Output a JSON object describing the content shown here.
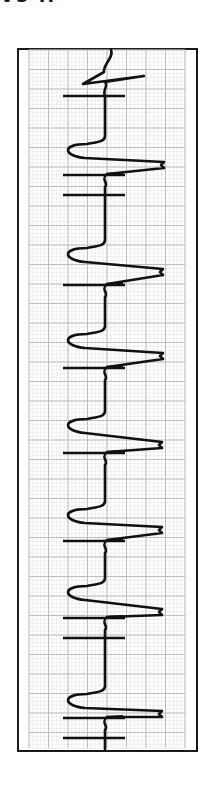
{
  "header": {
    "lead_label_fragment": "V5 II"
  },
  "colors": {
    "background": "#ffffff",
    "frame": "#1a1a1a",
    "grid_minor": "#e4e4e4",
    "grid_major": "#bdbdbd",
    "trace": "#111111"
  },
  "chart_data": {
    "type": "line",
    "xlabel": "",
    "ylabel": "",
    "grid": true,
    "orientation": "vertical",
    "frame": {
      "x": 17,
      "y": 48,
      "width": 179,
      "height": 702
    },
    "grid_area": {
      "x": 29,
      "y": 50,
      "width": 156,
      "height": 698,
      "major_step": 19.5,
      "minor_step": 3.9
    },
    "baseline_x": 105,
    "beats": [
      {
        "index": 0,
        "trough_y": 84,
        "trough_x": 83,
        "tip_y": 76,
        "tip_x": 144,
        "marks_y": [
          96
        ]
      },
      {
        "index": 1,
        "trough_y": 150,
        "trough_x": 67,
        "tip_y": 165,
        "tip_x": 164,
        "marks_y": [
          175,
          195
        ]
      },
      {
        "index": 2,
        "trough_y": 254,
        "trough_x": 67,
        "tip_y": 272,
        "tip_x": 163,
        "marks_y": [
          285
        ]
      },
      {
        "index": 3,
        "trough_y": 340,
        "trough_x": 67,
        "tip_y": 356,
        "tip_x": 163,
        "marks_y": [
          368
        ]
      },
      {
        "index": 4,
        "trough_y": 425,
        "trough_x": 67,
        "tip_y": 445,
        "tip_x": 162,
        "marks_y": [
          453
        ]
      },
      {
        "index": 5,
        "trough_y": 515,
        "trough_x": 67,
        "tip_y": 530,
        "tip_x": 162,
        "marks_y": [
          541
        ]
      },
      {
        "index": 6,
        "trough_y": 592,
        "trough_x": 67,
        "tip_y": 612,
        "tip_x": 162,
        "marks_y": [
          618,
          638
        ]
      },
      {
        "index": 7,
        "trough_y": 700,
        "trough_x": 67,
        "tip_y": 714,
        "tip_x": 162,
        "marks_y": [
          718,
          738
        ]
      }
    ],
    "mark_span_x": [
      63,
      125
    ]
  }
}
